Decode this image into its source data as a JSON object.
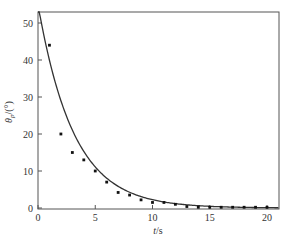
{
  "chart_data": {
    "type": "scatter",
    "title": "",
    "xlabel": "t/s",
    "ylabel": "θp/(°)",
    "xlim": [
      0,
      21
    ],
    "ylim": [
      0,
      53
    ],
    "grid": false,
    "legend": null,
    "xticks": [
      "0",
      "5",
      "10",
      "15",
      "20"
    ],
    "yticks": [
      "0",
      "10",
      "20",
      "30",
      "40",
      "50"
    ],
    "series": [
      {
        "name": "measured",
        "kind": "scatter",
        "x": [
          1,
          2,
          3,
          4,
          5,
          6,
          7,
          8,
          9,
          10,
          11,
          12,
          13,
          14,
          15,
          16,
          17,
          18,
          19,
          20
        ],
        "values": [
          44,
          20,
          15,
          13,
          10,
          7,
          4.2,
          3.5,
          2.2,
          1.5,
          1.5,
          1.0,
          0.4,
          0.2,
          0.2,
          0.2,
          0.2,
          0.2,
          0.2,
          0.2
        ]
      },
      {
        "name": "fitted",
        "kind": "line",
        "model": "y = 55 * exp(-0.32 t)",
        "x": [
          0,
          1,
          2,
          3,
          4,
          5,
          6,
          8,
          10,
          12,
          14,
          16,
          18,
          20,
          21
        ],
        "values": [
          55,
          39.9,
          29.0,
          21.1,
          15.3,
          11.1,
          8.1,
          4.3,
          2.2,
          1.2,
          0.6,
          0.3,
          0.2,
          0.1,
          0.1
        ]
      }
    ]
  },
  "axes": {
    "x_label_main": "t",
    "x_label_unit": "/s",
    "y_label_main": "θ",
    "y_label_sub": "p",
    "y_label_unit": "/(°)"
  }
}
